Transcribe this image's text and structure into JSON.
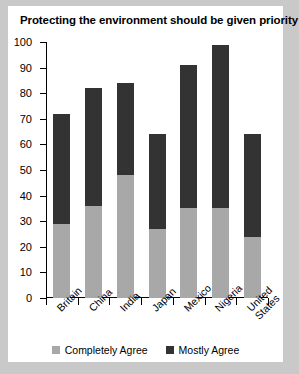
{
  "chart_data": {
    "type": "bar",
    "title": "Protecting the environment should be given priority",
    "xlabel": "",
    "ylabel": "",
    "ylim": [
      0,
      100
    ],
    "yticks": [
      0,
      10,
      20,
      30,
      40,
      50,
      60,
      70,
      80,
      90,
      100
    ],
    "grid": false,
    "stacked": true,
    "legend_position": "bottom",
    "categories": [
      "Britain",
      "China",
      "India",
      "Japan",
      "Mexico",
      "Nigeria",
      "United States"
    ],
    "series": [
      {
        "name": "Completely Agree",
        "color": "#a8a8a8",
        "values": [
          29,
          36,
          48,
          27,
          35,
          35,
          24
        ]
      },
      {
        "name": "Mostly Agree",
        "color": "#333333",
        "values": [
          43,
          46,
          36,
          37,
          56,
          64,
          40
        ]
      }
    ],
    "totals": [
      72,
      82,
      84,
      64,
      91,
      99,
      64
    ]
  },
  "legend": {
    "items": [
      {
        "label": "Completely Agree",
        "color": "#a8a8a8"
      },
      {
        "label": "Mostly Agree",
        "color": "#333333"
      }
    ]
  }
}
